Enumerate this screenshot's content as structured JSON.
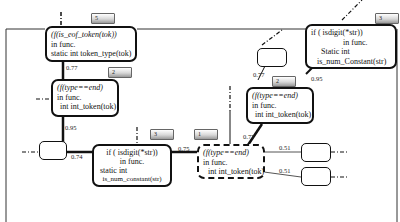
{
  "diagram": {
    "nodes": [
      {
        "id": "n1",
        "badge": "5",
        "lines": [
          "(f(is_eof_token(tok))",
          "in func.",
          "static int token_type(tok)"
        ]
      },
      {
        "id": "n2",
        "badge": "2",
        "lines": [
          "(f(type==end)",
          "in func.",
          "int int_token(tok)"
        ]
      },
      {
        "id": "n3",
        "badge": "3",
        "lines": [
          "if ( isdigit(*str))",
          "in func.",
          "static int",
          "is_num_constant(str)"
        ]
      },
      {
        "id": "n4",
        "badge": "1",
        "lines": [
          "(f(type==end)",
          "in func.",
          "int int_token(tok)"
        ]
      },
      {
        "id": "n5",
        "badge": "2",
        "lines": [
          "(f(type==end)",
          "in func.",
          "int int_token(tok)"
        ]
      },
      {
        "id": "n6",
        "badge": "3",
        "lines": [
          "if ( isdigit(*str))",
          "in func.",
          "Static int",
          "is_num_Constant(str)"
        ]
      }
    ],
    "edge_weights": {
      "n1_n2": "0.77",
      "n2_empty": "0.95",
      "empty_n3": "0.74",
      "n3_n4": "0.75",
      "n5_n4": "0.77",
      "empty2_n5": "0.77",
      "n6_n5": "0.95",
      "n4_out1": "0.51",
      "n4_out2": "0.51"
    }
  }
}
